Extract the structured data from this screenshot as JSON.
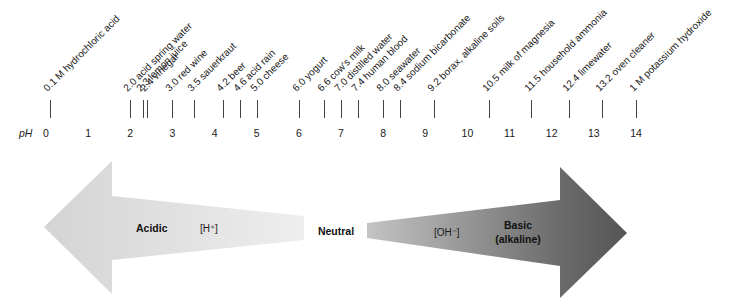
{
  "scale": {
    "axis_label": "pH",
    "numbers": [
      "0",
      "1",
      "2",
      "3",
      "4",
      "5",
      "6",
      "7",
      "8",
      "9",
      "10",
      "11",
      "12",
      "13",
      "14"
    ]
  },
  "substances": [
    {
      "ph": 0.1,
      "label": "0.1 M hydrochloric acid"
    },
    {
      "ph": 2.0,
      "label": "2.0 acid spring water"
    },
    {
      "ph": 2.3,
      "label": "2.3 lemon juice"
    },
    {
      "ph": 2.4,
      "label": "2.4 vinegar"
    },
    {
      "ph": 3.0,
      "label": "3.0 red wine"
    },
    {
      "ph": 3.5,
      "label": "3.5 sauerkraut"
    },
    {
      "ph": 4.2,
      "label": "4.2 beer"
    },
    {
      "ph": 4.6,
      "label": "4.6 acid rain"
    },
    {
      "ph": 5.0,
      "label": "5.0 cheese"
    },
    {
      "ph": 6.0,
      "label": "6.0 yogurt"
    },
    {
      "ph": 6.6,
      "label": "6.6 cow's milk"
    },
    {
      "ph": 7.0,
      "label": "7.0 distilled water"
    },
    {
      "ph": 7.4,
      "label": "7.4 human blood"
    },
    {
      "ph": 8.0,
      "label": "8.0 seawater"
    },
    {
      "ph": 8.4,
      "label": "8.4 sodium bicarbonate"
    },
    {
      "ph": 9.2,
      "label": "9.2 borax, alkaline soils"
    },
    {
      "ph": 10.5,
      "label": "10.5 milk of magnesia"
    },
    {
      "ph": 11.5,
      "label": "11.5 household ammonia"
    },
    {
      "ph": 12.4,
      "label": "12.4 limewater"
    },
    {
      "ph": 13.2,
      "label": "13.2 oven cleaner"
    },
    {
      "ph": 14,
      "label": "1 M potassium hydroxide"
    }
  ],
  "arrows": {
    "acidic": {
      "label": "Acidic",
      "ion": "[H⁺]",
      "color_head": "#d6d6d6",
      "color_tail": "#ededed"
    },
    "neutral": {
      "label": "Neutral"
    },
    "basic": {
      "label": "Basic",
      "sublabel": "(alkaline)",
      "ion": "[OH⁻]",
      "color_tail": "#c4c4c4",
      "color_head": "#575757"
    }
  }
}
